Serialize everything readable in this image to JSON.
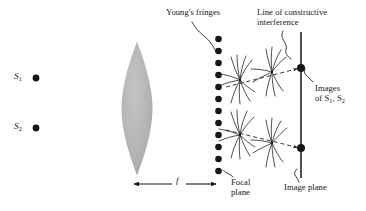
{
  "figure": {
    "title_role": "optics-diagram-youngs-fringes-lens-imaging",
    "background": "#ffffff",
    "ink": "#161616",
    "lens_fill": "#b3b3b3"
  },
  "labels": {
    "youngs_fringes": "Young's fringes",
    "line_of_constructive": "Line of constructive",
    "interference": "interference",
    "images": "Images",
    "of_sources_prefix": "of ",
    "of_sources_s1": "S",
    "of_sources_s1_sub": "1",
    "of_sources_sep": ", ",
    "of_sources_s2": "S",
    "of_sources_s2_sub": "2",
    "focal": "Focal",
    "plane": "plane",
    "image_plane": "Image plane",
    "focal_length_symbol": "f",
    "source_1": "S",
    "source_1_sub": "1",
    "source_2": "S",
    "source_2_sub": "2"
  },
  "geometry": {
    "sources": [
      {
        "name": "S1",
        "x": 36,
        "y": 78,
        "r": 3.4
      },
      {
        "name": "S2",
        "x": 36,
        "y": 128,
        "r": 3.4
      }
    ],
    "lens": {
      "cx": 137,
      "cy": 108.5,
      "rx": 15.5,
      "ry": 67
    },
    "focal_plane_dots": {
      "x": 218.5,
      "r": 3.3,
      "ys": [
        39,
        51,
        63,
        75,
        87,
        99,
        111,
        123,
        135,
        147,
        159,
        171
      ]
    },
    "image_plane_line": {
      "x": 301,
      "y_top": 32,
      "y_bottom": 178
    },
    "image_points": [
      {
        "name": "upper-image",
        "x": 301,
        "y": 68,
        "r": 4.0
      },
      {
        "name": "lower-image",
        "x": 301,
        "y": 148,
        "r": 4.0
      }
    ],
    "fringe_brushes": [
      {
        "cx": 240,
        "cy": 80
      },
      {
        "cx": 272,
        "cy": 72
      },
      {
        "cx": 240,
        "cy": 135
      },
      {
        "cx": 272,
        "cy": 143
      }
    ],
    "constructive_rays": [
      {
        "from_x": 228,
        "from_y": 86,
        "to_x": 299,
        "to_y": 68
      },
      {
        "from_x": 228,
        "from_y": 130,
        "to_x": 299,
        "to_y": 148
      }
    ],
    "focal_length_arrow": {
      "x1": 133,
      "x2": 217,
      "y": 184
    }
  }
}
